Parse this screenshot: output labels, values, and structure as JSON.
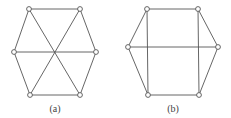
{
  "figure": {
    "stroke_color": "#555555",
    "node_fill": "#ffffff",
    "graphs": [
      {
        "id": "a",
        "caption": "(a)",
        "caption_pos": [
          55,
          103
        ],
        "nodes": [
          [
            29,
            9
          ],
          [
            80,
            9
          ],
          [
            96,
            52
          ],
          [
            80,
            95
          ],
          [
            30,
            95
          ],
          [
            14,
            52
          ]
        ],
        "edges": [
          [
            0,
            1
          ],
          [
            1,
            2
          ],
          [
            2,
            3
          ],
          [
            3,
            4
          ],
          [
            4,
            5
          ],
          [
            5,
            0
          ],
          [
            0,
            3
          ],
          [
            1,
            4
          ],
          [
            5,
            2
          ]
        ]
      },
      {
        "id": "b",
        "caption": "(b)",
        "caption_pos": [
          173,
          103
        ],
        "nodes": [
          [
            147,
            9
          ],
          [
            198,
            9
          ],
          [
            218,
            47
          ],
          [
            199,
            95
          ],
          [
            148,
            95
          ],
          [
            128,
            47
          ]
        ],
        "edges": [
          [
            0,
            1
          ],
          [
            1,
            2
          ],
          [
            2,
            3
          ],
          [
            3,
            4
          ],
          [
            4,
            5
          ],
          [
            5,
            0
          ],
          [
            0,
            4
          ],
          [
            1,
            3
          ],
          [
            5,
            2
          ]
        ]
      }
    ]
  }
}
